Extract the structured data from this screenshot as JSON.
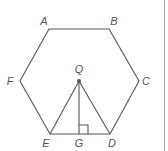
{
  "figure": {
    "vertices": {
      "A": {
        "label": "A",
        "x": 49,
        "y": 29,
        "lx": 44,
        "ly": 25
      },
      "B": {
        "label": "B",
        "x": 109,
        "y": 29,
        "lx": 114,
        "ly": 25
      },
      "C": {
        "label": "C",
        "x": 139,
        "y": 81,
        "lx": 146,
        "ly": 85
      },
      "D": {
        "label": "D",
        "x": 110,
        "y": 134,
        "lx": 112,
        "ly": 147
      },
      "E": {
        "label": "E",
        "x": 50,
        "y": 134,
        "lx": 46,
        "ly": 147
      },
      "F": {
        "label": "F",
        "x": 20,
        "y": 81,
        "lx": 10,
        "ly": 85
      }
    },
    "points": {
      "Q": {
        "label": "Q",
        "x": 79,
        "y": 81,
        "lx": 79,
        "ly": 73
      },
      "G": {
        "label": "G",
        "x": 79,
        "y": 134,
        "lx": 79,
        "ly": 147
      }
    },
    "right_angle_marker": {
      "x": 79,
      "y": 125,
      "size": 9
    },
    "colors": {
      "line": "#555555",
      "label": "#555555",
      "border": "#a8a8a8"
    }
  }
}
